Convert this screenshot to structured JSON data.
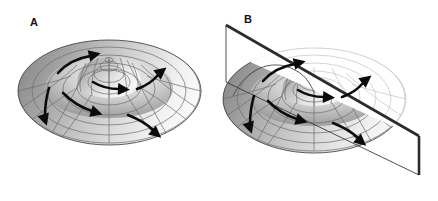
{
  "figure": {
    "background_color": "#ffffff",
    "width": 438,
    "height": 201,
    "type": "scientific-illustration"
  },
  "panels": [
    {
      "id": "A",
      "label": "A",
      "description": "Sombrero potential surface: axially symmetric brim with central peak, polar grid mesh, curved flow arrows circulating in the trough",
      "has_cutting_plane": false
    },
    {
      "id": "B",
      "label": "B",
      "description": "Same sombrero potential surface intersected by a tilted cutting plane; the portion above the plane is removed leaving an undulating cut edge, and the surface behind the plane is drawn faded",
      "has_cutting_plane": true
    }
  ],
  "surface": {
    "name": "sombrero-potential-surface",
    "grid": {
      "radial_spokes": 12,
      "concentric_rings": 7,
      "line_color": "#6d6d6d"
    },
    "shading": {
      "highlight_color": "#fdfdfd",
      "midtone_color": "#c9c9c9",
      "shadow_color": "#8a8a8a",
      "deep_shadow_color": "#6f6f6f"
    },
    "peak": {
      "name": "central-peak",
      "description": "central dome / local maximum at the origin"
    },
    "trough": {
      "name": "circular-trough",
      "description": "ring-shaped valley of degenerate minima"
    }
  },
  "arrows": {
    "name": "flow-arrow",
    "color": "#0b0b0b",
    "count_per_panel": 6,
    "description": "curved arrows indicating circulation around the central peak along the brim"
  },
  "cutting_plane": {
    "name": "cutting-plane",
    "edge_color": "#2b2b2b",
    "face_color": "#ffffff",
    "description": "tilted planar slice through the potential surface in panel B"
  }
}
